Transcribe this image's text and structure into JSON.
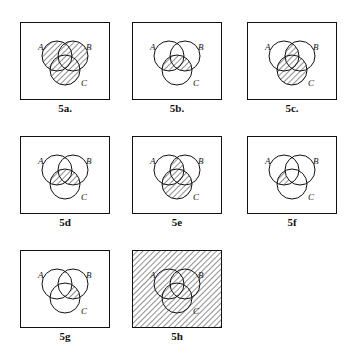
{
  "figure": {
    "set_labels": {
      "a": "A",
      "b": "B",
      "c": "C"
    },
    "panels": [
      {
        "id": "5a",
        "caption": "5a.",
        "shading": "A ∪ B ∪ C",
        "regions": [
          "a",
          "b",
          "c",
          "ab",
          "ac",
          "bc",
          "abc"
        ],
        "universe": false
      },
      {
        "id": "5b",
        "caption": "5b.",
        "shading": "(A ∪ B) ∩ C",
        "regions": [
          "ac",
          "bc",
          "abc"
        ],
        "universe": false
      },
      {
        "id": "5c",
        "caption": "5c.",
        "shading": "(A ∩ B) ∪ C",
        "regions": [
          "ab",
          "abc",
          "ac",
          "bc",
          "c"
        ],
        "universe": false
      },
      {
        "id": "5d",
        "caption": "5d",
        "shading": "(A ∪ B) ∩ C",
        "regions": [
          "ac",
          "bc",
          "abc"
        ],
        "universe": false
      },
      {
        "id": "5e",
        "caption": "5e",
        "shading": "(A ∩ B) ∪ C",
        "regions": [
          "ab",
          "abc",
          "ac",
          "bc",
          "c"
        ],
        "universe": false
      },
      {
        "id": "5f",
        "caption": "5f",
        "shading": "(A ∩ C) − B",
        "regions": [
          "ac"
        ],
        "universe": false
      },
      {
        "id": "5g",
        "caption": "5g",
        "shading": "(B ∩ C) − A",
        "regions": [
          "bc"
        ],
        "universe": false
      },
      {
        "id": "5h",
        "caption": "5h",
        "shading": "U",
        "regions": [
          "a",
          "b",
          "c",
          "ab",
          "ac",
          "bc",
          "abc"
        ],
        "universe": true
      }
    ]
  }
}
